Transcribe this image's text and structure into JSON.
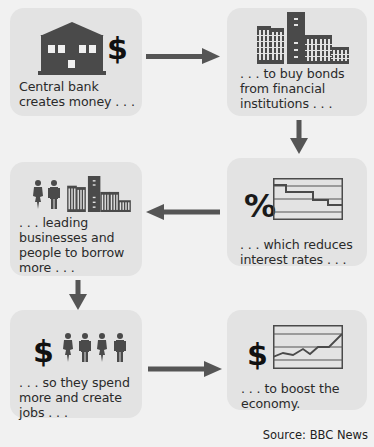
{
  "diagram": {
    "colors": {
      "background": "#f1f1f1",
      "box": "#e3e3e3",
      "icon": "#4a4a4a",
      "arrow": "#555555",
      "text": "#2a2a2a"
    },
    "steps": [
      {
        "id": "step-1",
        "icons": [
          "bank-building-icon",
          "dollar-icon"
        ],
        "lines": [
          "Central bank",
          "creates money . . ."
        ]
      },
      {
        "id": "step-2",
        "icons": [
          "office-buildings-icon"
        ],
        "lines": [
          ". . . to buy bonds",
          "from financial",
          "institutions . . ."
        ]
      },
      {
        "id": "step-3",
        "icons": [
          "percent-icon",
          "declining-rate-chart-icon"
        ],
        "lines": [
          ". . . which reduces",
          "interest rates . . ."
        ]
      },
      {
        "id": "step-4",
        "icons": [
          "people-icon",
          "office-buildings-icon"
        ],
        "lines": [
          ". . . leading",
          "businesses and",
          "people to borrow",
          "more . . ."
        ]
      },
      {
        "id": "step-5",
        "icons": [
          "dollar-icon",
          "people-icon"
        ],
        "lines": [
          ". . . so they spend",
          "more and create",
          "jobs . . ."
        ]
      },
      {
        "id": "step-6",
        "icons": [
          "dollar-icon",
          "rising-line-chart-icon"
        ],
        "lines": [
          ". . . to boost the",
          "economy."
        ]
      }
    ],
    "symbols": {
      "dollar": "$",
      "percent": "%"
    },
    "flow": [
      "step-1 → step-2",
      "step-2 ↓ step-3",
      "step-3 ← step-4",
      "step-4 ↓ step-5",
      "step-5 → step-6"
    ],
    "source": "Source: BBC News"
  }
}
